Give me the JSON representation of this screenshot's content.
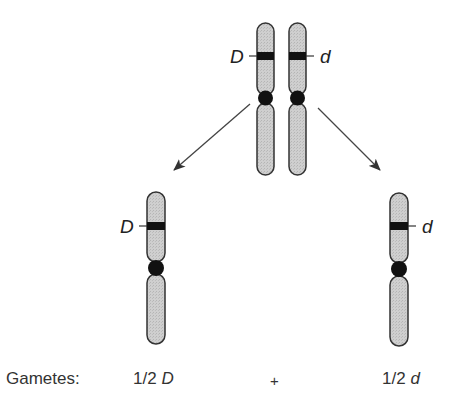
{
  "diagram": {
    "parent": {
      "left_allele": "D",
      "right_allele": "d"
    },
    "gamete_left": {
      "allele": "D"
    },
    "gamete_right": {
      "allele": "d"
    }
  },
  "footer": {
    "label": "Gametes:",
    "left_fraction": "1/2",
    "left_allele": "D",
    "operator": "+",
    "right_fraction": "1/2",
    "right_allele": "d"
  },
  "colors": {
    "chromosome_fill": "#c8c8c8",
    "chromosome_stroke": "#333333",
    "band": "#111111",
    "centromere": "#111111",
    "arrow": "#444444"
  }
}
